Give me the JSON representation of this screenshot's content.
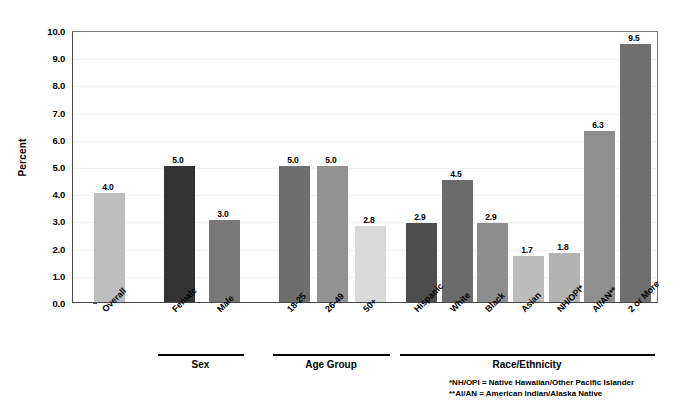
{
  "chart_data": {
    "type": "bar",
    "title": "",
    "xlabel": "",
    "ylabel": "Percent",
    "ylim": [
      0,
      10
    ],
    "ytick_step": 1.0,
    "grid": true,
    "legend": "none",
    "categories": [
      "Overall",
      "Female",
      "Male",
      "18-25",
      "26-49",
      "50+",
      "Hispanic",
      "White",
      "Black",
      "Asian",
      "NH/OPI*",
      "AI/AN**",
      "2 or More"
    ],
    "values": [
      4.0,
      5.0,
      3.0,
      5.0,
      5.0,
      2.8,
      2.9,
      4.5,
      2.9,
      1.7,
      1.8,
      6.3,
      9.5
    ],
    "value_labels": [
      "4.0",
      "5.0",
      "3.0",
      "5.0",
      "5.0",
      "2.8",
      "2.9",
      "4.5",
      "2.9",
      "1.7",
      "1.8",
      "6.3",
      "9.5"
    ],
    "bar_colors": [
      "#bebebe",
      "#333333",
      "#787878",
      "#6e6e6e",
      "#939393",
      "#d9d9d9",
      "#4d4d4d",
      "#6b6b6b",
      "#8d8d8d",
      "#bcbcbc",
      "#b3b3b3",
      "#8e8e8e",
      "#6f6f6f"
    ],
    "ytick_labels": [
      "10.0",
      "9.0",
      "8.0",
      "7.0",
      "6.0",
      "5.0",
      "4.0",
      "3.0",
      "2.0",
      "1.0",
      "0.0"
    ],
    "ytick_values": [
      10.0,
      9.0,
      8.0,
      7.0,
      6.0,
      5.0,
      4.0,
      3.0,
      2.0,
      1.0,
      0.0
    ],
    "groups": [
      {
        "label": "Sex",
        "members": [
          "Female",
          "Male"
        ]
      },
      {
        "label": "Age Group",
        "members": [
          "18-25",
          "26-49",
          "50+"
        ]
      },
      {
        "label": "Race/Ethnicity",
        "members": [
          "Hispanic",
          "White",
          "Black",
          "Asian",
          "NH/OPI*",
          "AI/AN**",
          "2 or More"
        ]
      }
    ],
    "footnotes": [
      "*NH/OPI = Native Hawaiian/Other Pacific Islander",
      "**AI/AN = American Indian/Alaska Native"
    ]
  }
}
